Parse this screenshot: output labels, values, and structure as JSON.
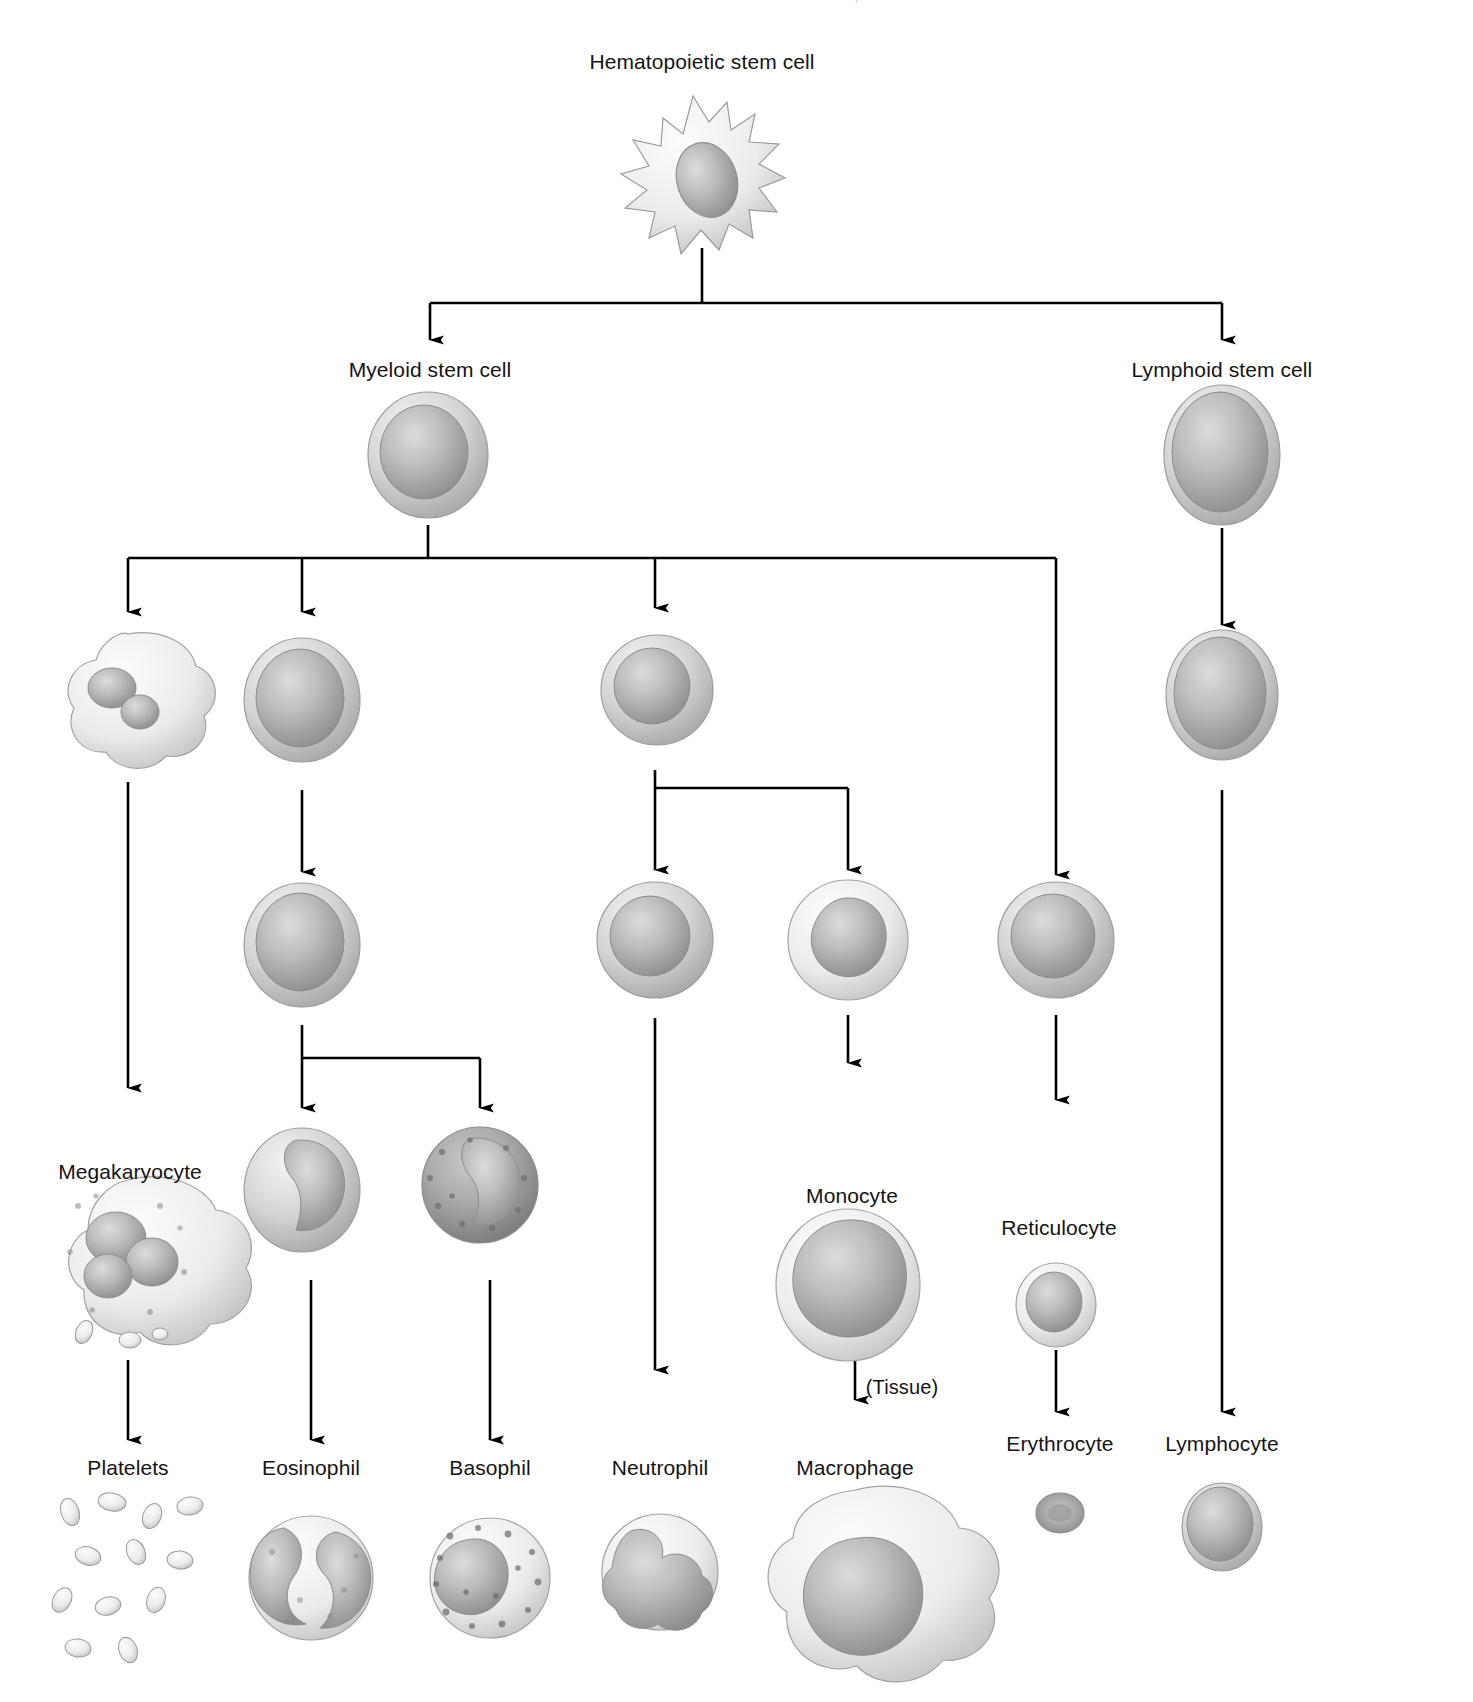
{
  "figure": {
    "type": "diagram",
    "background_color": "#ffffff",
    "line_color": "#000000",
    "text_color": "#141414",
    "cell_fill": "#b9b9b9",
    "cut_off_header_text": "l"
  },
  "nodes": {
    "hsc": {
      "label": "Hematopoietic stem cell",
      "x": 702,
      "y": 62,
      "cell_x": 693,
      "cell_y": 172
    },
    "myeloid": {
      "label": "Myeloid stem cell",
      "x": 430,
      "y": 370,
      "cell_x": 428,
      "cell_y": 455
    },
    "lymphoid": {
      "label": "Lymphoid stem cell",
      "x": 1222,
      "y": 370,
      "cell_x": 1222,
      "cell_y": 455
    },
    "megakaryoblast": {
      "label": "",
      "x": 128,
      "y": 0,
      "cell_x": 128,
      "cell_y": 700
    },
    "eosinophil_progenitor": {
      "label": "",
      "x": 302,
      "y": 0,
      "cell_x": 302,
      "cell_y": 700
    },
    "granulocyte_progenitor": {
      "label": "",
      "x": 655,
      "y": 0,
      "cell_x": 657,
      "cell_y": 690
    },
    "lymphoblast": {
      "label": "",
      "x": 1222,
      "y": 0,
      "cell_x": 1222,
      "cell_y": 695
    },
    "myelocyte": {
      "label": "",
      "x": 302,
      "y": 0,
      "cell_x": 302,
      "cell_y": 945
    },
    "band_cell": {
      "label": "",
      "x": 655,
      "y": 0,
      "cell_x": 655,
      "cell_y": 940
    },
    "promonocyte": {
      "label": "",
      "x": 848,
      "y": 0,
      "cell_x": 848,
      "cell_y": 940
    },
    "erythroblast": {
      "label": "",
      "x": 1056,
      "y": 0,
      "cell_x": 1056,
      "cell_y": 940
    },
    "megakaryocyte": {
      "label": "Megakaryocyte",
      "x": 128,
      "y": 1172,
      "cell_x": 128,
      "cell_y": 1250
    },
    "eosinophil_band": {
      "label": "",
      "x": 302,
      "y": 0,
      "cell_x": 302,
      "cell_y": 1190
    },
    "basophil_band": {
      "label": "",
      "x": 480,
      "y": 0,
      "cell_x": 480,
      "cell_y": 1185
    },
    "monocyte": {
      "label": "Monocyte",
      "x": 848,
      "y": 1196,
      "cell_x": 848,
      "cell_y": 1285
    },
    "reticulocyte": {
      "label": "Reticulocyte",
      "x": 1056,
      "y": 1228,
      "cell_x": 1056,
      "cell_y": 1305
    },
    "platelets": {
      "label": "Platelets",
      "x": 128,
      "y": 1468,
      "cell_x": 128,
      "cell_y": 1580
    },
    "eosinophil": {
      "label": "Eosinophil",
      "x": 311,
      "y": 1468,
      "cell_x": 311,
      "cell_y": 1575
    },
    "basophil": {
      "label": "Basophil",
      "x": 490,
      "y": 1468,
      "cell_x": 490,
      "cell_y": 1575
    },
    "neutrophil": {
      "label": "Neutrophil",
      "x": 660,
      "y": 1468,
      "cell_x": 660,
      "cell_y": 1570
    },
    "macrophage": {
      "label": "Macrophage",
      "x": 855,
      "y": 1468,
      "cell_x": 855,
      "cell_y": 1590
    },
    "erythrocyte": {
      "label": "Erythrocyte",
      "x": 1060,
      "y": 1443,
      "cell_x": 1060,
      "cell_y": 1513
    },
    "lymphocyte": {
      "label": "Lymphocyte",
      "x": 1222,
      "y": 1443,
      "cell_x": 1222,
      "cell_y": 1525
    }
  },
  "annotations": [
    {
      "name": "tissue-note",
      "label": "(Tissue)",
      "x": 902,
      "y": 1388
    }
  ],
  "edges": [
    {
      "from": "hsc",
      "to": "myeloid"
    },
    {
      "from": "hsc",
      "to": "lymphoid"
    },
    {
      "from": "myeloid",
      "to": "megakaryoblast"
    },
    {
      "from": "myeloid",
      "to": "eosinophil_progenitor"
    },
    {
      "from": "myeloid",
      "to": "granulocyte_progenitor"
    },
    {
      "from": "myeloid",
      "to": "erythroblast"
    },
    {
      "from": "lymphoid",
      "to": "lymphoblast"
    },
    {
      "from": "megakaryoblast",
      "to": "megakaryocyte"
    },
    {
      "from": "eosinophil_progenitor",
      "to": "myelocyte"
    },
    {
      "from": "granulocyte_progenitor",
      "to": "band_cell"
    },
    {
      "from": "granulocyte_progenitor",
      "to": "promonocyte"
    },
    {
      "from": "myelocyte",
      "to": "eosinophil_band"
    },
    {
      "from": "myelocyte",
      "to": "basophil_band"
    },
    {
      "from": "band_cell",
      "to": "neutrophil"
    },
    {
      "from": "promonocyte",
      "to": "monocyte"
    },
    {
      "from": "monocyte",
      "to": "macrophage"
    },
    {
      "from": "erythroblast",
      "to": "reticulocyte"
    },
    {
      "from": "reticulocyte",
      "to": "erythrocyte"
    },
    {
      "from": "lymphoblast",
      "to": "lymphocyte"
    },
    {
      "from": "megakaryocyte",
      "to": "platelets"
    },
    {
      "from": "eosinophil_band",
      "to": "eosinophil"
    },
    {
      "from": "basophil_band",
      "to": "basophil"
    }
  ]
}
